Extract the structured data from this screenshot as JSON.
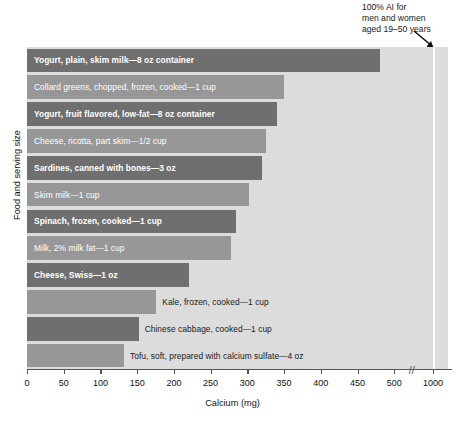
{
  "chart_data": {
    "type": "bar",
    "orientation": "horizontal",
    "title": "",
    "xlabel": "Calcium (mg)",
    "ylabel": "Food and serving size",
    "xlim": [
      0,
      1000
    ],
    "xticks": [
      0,
      50,
      100,
      150,
      200,
      250,
      300,
      350,
      400,
      450,
      500,
      1000
    ],
    "xtick_labels": [
      "0",
      "50",
      "100",
      "150",
      "200",
      "250",
      "300",
      "350",
      "400",
      "450",
      "500",
      "1000"
    ],
    "axis_break": {
      "between": [
        500,
        1000
      ],
      "symbol": "//"
    },
    "grid": false,
    "legend": null,
    "categories": [
      "Yogurt, plain, skim milk—8 oz container",
      "Collard greens, chopped, frozen, cooked—1 cup",
      "Yogurt, fruit flavored, low-fat—8 oz container",
      "Cheese, ricotta, part skim—1/2 cup",
      "Sardines, canned with bones—3 oz",
      "Skim milk—1 cup",
      "Spinach, frozen, cooked—1 cup",
      "Milk, 2% milk fat—1 cup",
      "Cheese, Swiss—1 oz",
      "Kale, frozen, cooked—1 cup",
      "Chinese cabbage, cooked—1 cup",
      "Tofu, soft, prepared with calcium sulfate—4 oz"
    ],
    "values": [
      480,
      350,
      340,
      325,
      320,
      302,
      285,
      278,
      220,
      176,
      152,
      132
    ],
    "bars": [
      {
        "label": "Yogurt, plain, skim milk—8 oz container",
        "value": 480,
        "shade": "dark",
        "label_position": "inside",
        "bold": true
      },
      {
        "label": "Collard greens, chopped, frozen, cooked—1 cup",
        "value": 350,
        "shade": "light",
        "label_position": "inside",
        "bold": false
      },
      {
        "label": "Yogurt, fruit flavored, low-fat—8 oz container",
        "value": 340,
        "shade": "dark",
        "label_position": "inside",
        "bold": true
      },
      {
        "label": "Cheese, ricotta, part skim—1/2 cup",
        "value": 325,
        "shade": "light",
        "label_position": "inside",
        "bold": false
      },
      {
        "label": "Sardines, canned with bones—3 oz",
        "value": 320,
        "shade": "dark",
        "label_position": "inside",
        "bold": true
      },
      {
        "label": "Skim milk—1 cup",
        "value": 302,
        "shade": "light",
        "label_position": "inside",
        "bold": false
      },
      {
        "label": "Spinach, frozen, cooked—1 cup",
        "value": 285,
        "shade": "dark",
        "label_position": "inside",
        "bold": true
      },
      {
        "label": "Milk, 2% milk fat—1 cup",
        "value": 278,
        "shade": "light",
        "label_position": "inside",
        "bold": false
      },
      {
        "label": "Cheese, Swiss—1 oz",
        "value": 220,
        "shade": "dark",
        "label_position": "inside",
        "bold": true
      },
      {
        "label": "Kale, frozen, cooked—1 cup",
        "value": 176,
        "shade": "light",
        "label_position": "outside",
        "bold": false
      },
      {
        "label": "Chinese cabbage, cooked—1 cup",
        "value": 152,
        "shade": "dark",
        "label_position": "outside",
        "bold": false
      },
      {
        "label": "Tofu, soft, prepared with calcium sulfate—4 oz",
        "value": 132,
        "shade": "light",
        "label_position": "outside",
        "bold": false
      }
    ],
    "reference_line": {
      "value": 1000,
      "color": "#ffffff",
      "annotation": "100% AI for men and women aged 19–50 years"
    },
    "colors": {
      "bar_dark": "#6f6f6f",
      "bar_light": "#979797",
      "plot_background": "#dcdcdc",
      "axis": "#555555",
      "label_inside": "#ffffff",
      "label_outside": "#1a1a1a"
    }
  },
  "annotation": {
    "line1": "100% AI for",
    "line2": "men and women",
    "line3": "aged 19–50 years"
  },
  "axis": {
    "x_title": "Calcium (mg)",
    "y_title": "Food and serving size",
    "break_symbol": "//"
  }
}
